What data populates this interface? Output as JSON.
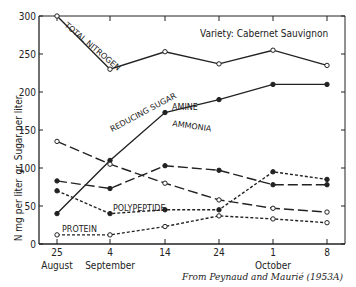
{
  "chart_data": {
    "type": "line",
    "title": "Variety: Cabernet Sauvignon",
    "caption": "From Peynaud and Maurié (1953A)",
    "xlabel": "",
    "ylabel_upper": "gr. Sugar per liter",
    "ylabel_lower": "N mg per liter",
    "ylim": [
      0,
      300
    ],
    "yticks": [
      0,
      50,
      100,
      150,
      200,
      250,
      300
    ],
    "categories": [
      "25 August",
      "4 September",
      "14",
      "24",
      "1 October",
      "8"
    ],
    "x_tick_labels": [
      "25",
      "4",
      "14",
      "24",
      "1",
      "8"
    ],
    "x_month_labels": [
      {
        "label": "August",
        "at": 0
      },
      {
        "label": "September",
        "at": 1
      },
      {
        "label": "October",
        "at": 4
      }
    ],
    "grid": false,
    "series": [
      {
        "name": "TOTAL NITROGEN",
        "style": "solid",
        "marker": "open",
        "values": [
          300,
          230,
          253,
          237,
          255,
          235
        ]
      },
      {
        "name": "REDUCING SUGAR",
        "style": "solid",
        "marker": "filled",
        "values": [
          40,
          110,
          173,
          190,
          210,
          210
        ]
      },
      {
        "name": "AMINE",
        "style": "long-dash",
        "marker": "filled",
        "values": [
          83,
          73,
          103,
          97,
          78,
          78
        ]
      },
      {
        "name": "AMMONIA",
        "style": "long-dash",
        "marker": "open",
        "values": [
          135,
          105,
          80,
          58,
          47,
          42
        ]
      },
      {
        "name": "POLYPEPTIDE",
        "style": "short-dash",
        "marker": "filled",
        "values": [
          70,
          40,
          45,
          45,
          95,
          85
        ]
      },
      {
        "name": "PROTEIN",
        "style": "short-dash",
        "marker": "open",
        "values": [
          12,
          12,
          23,
          37,
          33,
          28
        ]
      }
    ]
  }
}
